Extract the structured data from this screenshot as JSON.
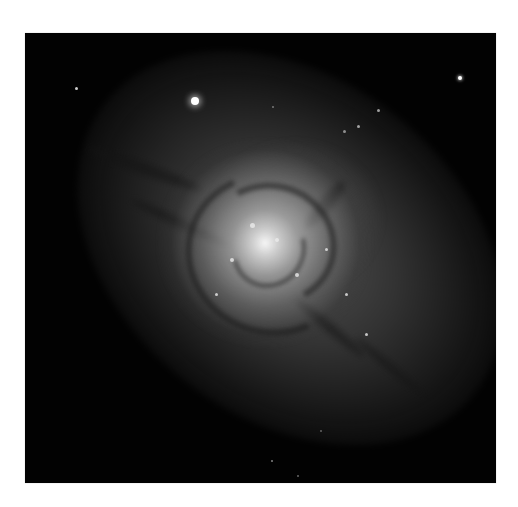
{
  "image": {
    "subject": "overlapping spiral galaxies (grayscale astronomical photograph)",
    "frame": {
      "x": 25,
      "y": 33,
      "width": 471,
      "height": 450,
      "background": "#020202"
    },
    "page_background": "#ffffff",
    "features": {
      "galaxy_core": {
        "x": 263,
        "y": 250,
        "color": "#f5f5f5"
      },
      "elongated_disk_angle_deg": -38,
      "bright_stars": [
        {
          "x": 195,
          "y": 101,
          "radius": 4
        },
        {
          "x": 459,
          "y": 77,
          "radius": 2
        },
        {
          "x": 76,
          "y": 88,
          "radius": 1.5
        },
        {
          "x": 378,
          "y": 110,
          "radius": 1.5
        },
        {
          "x": 357,
          "y": 125,
          "radius": 1.5
        }
      ]
    }
  }
}
